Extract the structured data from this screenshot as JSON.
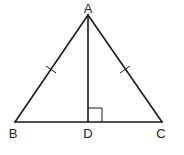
{
  "diagram": {
    "type": "isosceles-triangle-with-altitude",
    "points": {
      "A": {
        "label": "A",
        "x": 88,
        "y": 15
      },
      "B": {
        "label": "B",
        "x": 15,
        "y": 122
      },
      "C": {
        "label": "C",
        "x": 162,
        "y": 122
      },
      "D": {
        "label": "D",
        "x": 88,
        "y": 122
      }
    },
    "segments": [
      "AB",
      "AC",
      "BC",
      "AD"
    ],
    "equal_marks": [
      "AB",
      "AC"
    ],
    "right_angle_at": "D",
    "labels": {
      "A": "A",
      "B": "B",
      "C": "C",
      "D": "D"
    }
  }
}
